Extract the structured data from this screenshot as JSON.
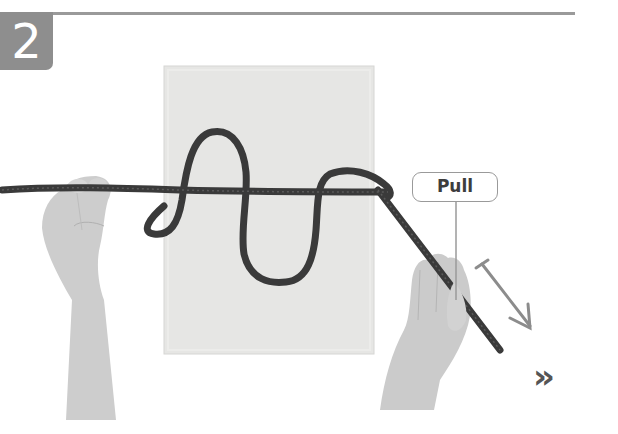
{
  "step": {
    "number": "2"
  },
  "callout": {
    "label": "Pull"
  },
  "navigation": {
    "next_glyph": "»"
  },
  "colors": {
    "badge": "#8e8e8e",
    "rule": "#9a9a9a",
    "rope": "#3a3a3a",
    "fabric": "#e4e4e2",
    "arrow": "#8c8c8c",
    "skin": "#cfcfcf"
  },
  "icons": {
    "pull-direction": "arrow-down-right-icon",
    "next": "double-chevron-right-icon"
  }
}
